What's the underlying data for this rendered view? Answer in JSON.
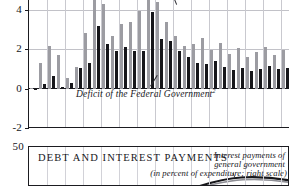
{
  "figure": {
    "type": "composite-figure",
    "top_panel": {
      "y_axis": {
        "ticks": [
          "4",
          "2",
          "0",
          "-2"
        ],
        "values": [
          4,
          2,
          0,
          -2
        ],
        "min": -2,
        "max": 5.2
      },
      "annotation": "Deficit of the Federal Government",
      "annotation_footnote": "2",
      "grid": true
    },
    "bottom_panel": {
      "title": "DEBT AND INTEREST PAYMENTS",
      "y_axis_top_tick": "50",
      "annotation_line1": "Interest payments of",
      "annotation_line2": "general government",
      "annotation_line3": "(in percent of expenditure; right scale)"
    }
  },
  "chart_data": {
    "type": "bar",
    "title": "",
    "xlabel": "",
    "ylabel": "",
    "ylim": [
      -2,
      5.2
    ],
    "grid": true,
    "legend_position": "inline-annotation",
    "annotations": [
      {
        "text": "Deficit of the Federal Government2",
        "style": "italic",
        "leader": true
      },
      {
        "text": "leader-line-top-right",
        "style": "line"
      }
    ],
    "categories": [
      "1",
      "2",
      "3",
      "4",
      "5",
      "6",
      "7",
      "8",
      "9",
      "10",
      "11",
      "12",
      "13",
      "14",
      "15",
      "16",
      "17",
      "18",
      "19",
      "20",
      "21",
      "22",
      "23",
      "24",
      "25",
      "26",
      "27",
      "28",
      "29"
    ],
    "series": [
      {
        "name": "General government deficit",
        "color": "#9c9ca2",
        "values": [
          0.05,
          1.3,
          2.15,
          1.68,
          0.55,
          1.1,
          2.82,
          4.95,
          4.3,
          2.65,
          3.25,
          3.35,
          3.95,
          5.15,
          4.4,
          3.35,
          2.65,
          2.15,
          2.25,
          2.55,
          1.95,
          2.3,
          1.75,
          2.05,
          1.6,
          1.85,
          2.1,
          1.7,
          1.95
        ]
      },
      {
        "name": "Deficit of the Federal Government",
        "color": "#16161a",
        "values": [
          -0.08,
          0.22,
          0.66,
          0.06,
          0.3,
          1.02,
          1.3,
          3.18,
          2.28,
          1.92,
          2.1,
          1.9,
          1.9,
          3.9,
          2.5,
          2.42,
          1.92,
          1.62,
          1.32,
          1.22,
          1.42,
          1.1,
          0.95,
          1.05,
          0.9,
          1.0,
          1.15,
          0.98,
          1.05
        ]
      }
    ]
  }
}
